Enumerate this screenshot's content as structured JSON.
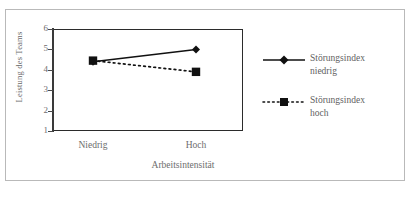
{
  "chart_data": {
    "type": "line",
    "title": "",
    "subtitle": "",
    "xlabel": "Arbeitsintensität",
    "ylabel": "Leistung des Teams",
    "categories": [
      "Niedrig",
      "Hoch"
    ],
    "ylim": [
      1,
      6
    ],
    "yticks": [
      1,
      2,
      3,
      4,
      5,
      6
    ],
    "ytick_labels": [
      "1",
      "2",
      "3",
      "4",
      "5",
      "6"
    ],
    "grid": false,
    "legend_position": "right",
    "series": [
      {
        "name": "Störungsindex niedrig",
        "values": [
          4.4,
          5.0
        ],
        "line_style": "solid",
        "marker": "diamond",
        "color": "#111111"
      },
      {
        "name": "Störungsindex hoch",
        "values": [
          4.45,
          3.9
        ],
        "line_style": "dotted",
        "marker": "square",
        "color": "#111111"
      }
    ]
  },
  "legend": {
    "entries": [
      {
        "label_line1": "Störungsindex",
        "label_line2": "niedrig"
      },
      {
        "label_line1": "Störungsindex",
        "label_line2": "hoch"
      }
    ]
  },
  "axis": {
    "y_title": "Leistung des Teams",
    "x_title": "Arbeitsintensität",
    "x_cat_1": "Niedrig",
    "x_cat_2": "Hoch",
    "y_6": "6",
    "y_5": "5",
    "y_4": "4",
    "y_3": "3",
    "y_2": "2",
    "y_1": "1"
  },
  "colors": {
    "ink": "#111111",
    "axis": "#2b2b2b",
    "text": "#6d6d6d",
    "frame": "#b9b9b9"
  }
}
